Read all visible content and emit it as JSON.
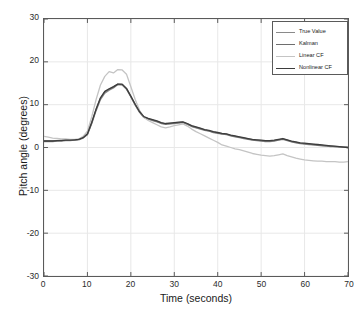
{
  "chart_data": {
    "type": "line",
    "title": "",
    "xlabel": "Time (seconds)",
    "ylabel": "Pitch angle (degrees)",
    "xlim": [
      0,
      70
    ],
    "ylim": [
      -30,
      30
    ],
    "xticks": [
      0,
      10,
      20,
      30,
      40,
      50,
      60,
      70
    ],
    "yticks": [
      30,
      20,
      10,
      0,
      -10,
      -20,
      -30
    ],
    "grid": true,
    "legend_position": "upper right",
    "x": [
      0,
      1,
      2,
      3,
      4,
      5,
      6,
      7,
      8,
      9,
      10,
      11,
      12,
      13,
      14,
      15,
      16,
      17,
      18,
      19,
      20,
      21,
      22,
      23,
      24,
      25,
      26,
      27,
      28,
      29,
      30,
      31,
      32,
      33,
      34,
      35,
      36,
      37,
      38,
      39,
      40,
      41,
      42,
      43,
      44,
      45,
      46,
      47,
      48,
      49,
      50,
      51,
      52,
      53,
      54,
      55,
      56,
      57,
      58,
      59,
      60,
      61,
      62,
      63,
      64,
      65,
      66,
      67,
      68,
      69,
      70
    ],
    "series": [
      {
        "name": "True Value",
        "color": "#8a8a8a",
        "values": [
          1.4,
          1.4,
          1.4,
          1.5,
          1.5,
          1.6,
          1.6,
          1.7,
          1.8,
          2.2,
          3.0,
          5.6,
          8.6,
          11.2,
          12.7,
          13.4,
          13.9,
          14.7,
          14.6,
          13.6,
          11.8,
          9.9,
          8.2,
          7.0,
          6.6,
          6.3,
          6.0,
          5.6,
          5.4,
          5.5,
          5.6,
          5.7,
          5.8,
          5.4,
          4.9,
          4.6,
          4.3,
          4.0,
          3.8,
          3.5,
          3.3,
          3.1,
          3.0,
          2.7,
          2.5,
          2.3,
          2.1,
          1.9,
          1.7,
          1.6,
          1.5,
          1.4,
          1.4,
          1.5,
          1.7,
          1.9,
          1.6,
          1.3,
          1.1,
          0.9,
          0.8,
          0.7,
          0.6,
          0.5,
          0.4,
          0.3,
          0.2,
          0.2,
          0.1,
          0.1,
          0.0
        ]
      },
      {
        "name": "Kalman",
        "color": "#6e6e6e",
        "values": [
          1.6,
          1.6,
          1.6,
          1.6,
          1.7,
          1.7,
          1.8,
          1.8,
          1.9,
          2.3,
          3.1,
          5.8,
          8.9,
          11.5,
          13.0,
          13.6,
          14.1,
          14.8,
          14.7,
          13.7,
          11.9,
          10.0,
          8.3,
          7.1,
          6.7,
          6.4,
          6.1,
          5.7,
          5.5,
          5.6,
          5.7,
          5.8,
          5.9,
          5.5,
          5.0,
          4.7,
          4.4,
          4.1,
          3.9,
          3.6,
          3.4,
          3.2,
          3.1,
          2.8,
          2.6,
          2.4,
          2.2,
          2.0,
          1.8,
          1.7,
          1.6,
          1.5,
          1.5,
          1.6,
          1.8,
          2.0,
          1.7,
          1.4,
          1.2,
          1.0,
          0.9,
          0.8,
          0.7,
          0.6,
          0.5,
          0.4,
          0.3,
          0.2,
          0.2,
          0.1,
          0.0
        ]
      },
      {
        "name": "Linear CF",
        "color": "#c4c4c4",
        "values": [
          2.6,
          2.4,
          2.2,
          2.1,
          2.0,
          2.0,
          1.9,
          1.9,
          2.0,
          2.6,
          3.8,
          7.2,
          11.2,
          14.6,
          16.6,
          17.7,
          17.4,
          18.2,
          18.1,
          17.1,
          14.2,
          11.2,
          8.7,
          7.0,
          6.3,
          5.8,
          5.3,
          4.8,
          4.6,
          4.8,
          5.1,
          5.3,
          5.5,
          5.0,
          4.3,
          3.7,
          3.2,
          2.7,
          2.2,
          1.7,
          1.2,
          0.6,
          0.3,
          0.0,
          -0.3,
          -0.5,
          -0.8,
          -1.1,
          -1.4,
          -1.6,
          -1.8,
          -1.9,
          -2.0,
          -1.9,
          -1.7,
          -1.5,
          -1.9,
          -2.2,
          -2.5,
          -2.7,
          -2.9,
          -3.0,
          -3.1,
          -3.2,
          -3.2,
          -3.3,
          -3.3,
          -3.3,
          -3.4,
          -3.4,
          -3.3
        ]
      },
      {
        "name": "Nonlinear CF",
        "color": "#3d3d3d",
        "values": [
          1.5,
          1.5,
          1.5,
          1.6,
          1.6,
          1.7,
          1.7,
          1.8,
          1.9,
          2.3,
          3.2,
          5.9,
          9.0,
          11.6,
          13.1,
          13.7,
          14.2,
          14.8,
          14.8,
          13.8,
          12.0,
          10.1,
          8.4,
          7.2,
          6.8,
          6.5,
          6.2,
          5.8,
          5.6,
          5.7,
          5.8,
          5.9,
          6.0,
          5.6,
          5.1,
          4.8,
          4.5,
          4.2,
          4.0,
          3.7,
          3.5,
          3.3,
          3.2,
          2.9,
          2.7,
          2.5,
          2.3,
          2.1,
          1.9,
          1.8,
          1.7,
          1.6,
          1.6,
          1.7,
          1.9,
          2.1,
          1.8,
          1.5,
          1.3,
          1.1,
          1.0,
          0.9,
          0.8,
          0.7,
          0.6,
          0.5,
          0.4,
          0.3,
          0.2,
          0.1,
          0.0
        ]
      }
    ]
  },
  "axes": {
    "xlabel": "Time (seconds)",
    "ylabel": "Pitch angle (degrees)",
    "xticks": [
      "0",
      "10",
      "20",
      "30",
      "40",
      "50",
      "60",
      "70"
    ],
    "yticks": [
      "30",
      "20",
      "10",
      "0",
      "-10",
      "-20",
      "-30"
    ]
  },
  "legend": {
    "items": [
      {
        "label": "True Value",
        "color": "#8a8a8a"
      },
      {
        "label": "Kalman",
        "color": "#6e6e6e"
      },
      {
        "label": "Linear CF",
        "color": "#c4c4c4"
      },
      {
        "label": "Nonlinear CF",
        "color": "#3d3d3d"
      }
    ]
  },
  "style": {
    "grid_color": "#e8e8e8",
    "axis_color": "#5a5a5a",
    "background": "#ffffff"
  }
}
